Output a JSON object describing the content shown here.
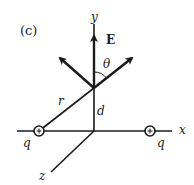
{
  "figure": {
    "panel_label": "(c)",
    "axes": {
      "x": "x",
      "y": "y",
      "z": "z"
    },
    "field_label": "E",
    "angle_label": "θ",
    "distance_r": "r",
    "distance_d": "d",
    "charges": [
      {
        "label": "q",
        "sign": "+"
      },
      {
        "label": "q",
        "sign": "+"
      }
    ],
    "colors": {
      "stroke": "#1a1a1a",
      "background": "#ffffff"
    }
  }
}
